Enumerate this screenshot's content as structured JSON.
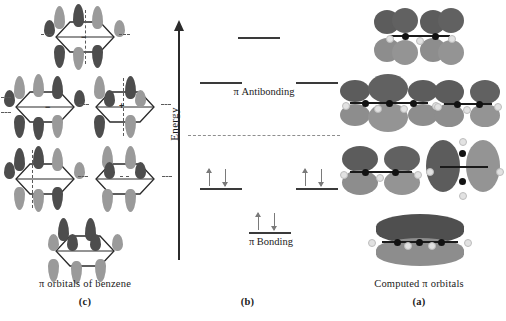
{
  "figure": {
    "background_color": "#ffffff"
  },
  "panel_c": {
    "caption_title": "π orbitals of benzene",
    "caption_letter": "(c)",
    "orbitals": [
      {
        "name": "highest-antibonding",
        "label": "",
        "node_count": 3
      },
      {
        "name": "antibonding-degenerate-left",
        "label": "",
        "node_count": 2
      },
      {
        "name": "antibonding-degenerate-right",
        "label": "",
        "node_count": 2
      },
      {
        "name": "bonding-degenerate-left",
        "label": "",
        "node_count": 1
      },
      {
        "name": "bonding-degenerate-right",
        "label": "",
        "node_count": 1
      },
      {
        "name": "lowest-bonding",
        "label": "",
        "node_count": 0
      }
    ],
    "sign_symbols": {
      "plus": "+",
      "minus": "−"
    }
  },
  "panel_b": {
    "caption_title": "",
    "caption_letter": "(b)",
    "axis_label": "Energy",
    "antibonding_label": "π Antibonding",
    "bonding_label": "π Bonding",
    "levels": [
      {
        "name": "level-6",
        "electrons": 0,
        "tier": "antibonding-top"
      },
      {
        "name": "level-4",
        "electrons": 0,
        "tier": "antibonding-degenerate"
      },
      {
        "name": "level-5",
        "electrons": 0,
        "tier": "antibonding-degenerate"
      },
      {
        "name": "level-2",
        "electrons": 2,
        "tier": "bonding-degenerate"
      },
      {
        "name": "level-3",
        "electrons": 2,
        "tier": "bonding-degenerate"
      },
      {
        "name": "level-1",
        "electrons": 2,
        "tier": "bonding-lowest"
      }
    ],
    "total_pi_electrons": 6
  },
  "panel_a": {
    "caption_title": "Computed π orbitals",
    "caption_letter": "(a)",
    "orbitals": [
      {
        "name": "computed-highest-antibonding"
      },
      {
        "name": "computed-antibonding-left"
      },
      {
        "name": "computed-antibonding-right"
      },
      {
        "name": "computed-bonding-left"
      },
      {
        "name": "computed-bonding-right"
      },
      {
        "name": "computed-lowest-bonding"
      }
    ]
  },
  "colors": {
    "lobe_dark": "#4d4d4d",
    "lobe_light": "#9a9a9a",
    "axis": "#2b2b2b",
    "level": "#3a3a3a",
    "dashed": "#8e8e8e",
    "electron_arrow": "#7a7a7a",
    "surface_upper": "#5c5c5c",
    "surface_lower": "#8d8d8d",
    "carbon": "#121212",
    "hydrogen": "#e2e2e2"
  }
}
